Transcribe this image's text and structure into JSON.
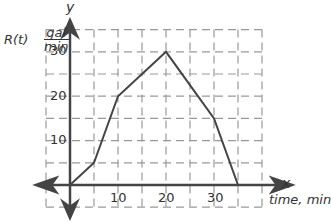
{
  "chart_data": {
    "type": "line",
    "title": "",
    "xlabel": "time, min",
    "ylabel": "R(t) gal/min",
    "x_axis_name": "x",
    "y_axis_name": "y",
    "x": [
      0,
      5,
      10,
      20,
      30,
      35
    ],
    "series": [
      {
        "name": "R(t)",
        "values": [
          0,
          5,
          20,
          30,
          15,
          0
        ]
      }
    ],
    "xlim": [
      -5,
      40
    ],
    "ylim": [
      -5,
      35
    ],
    "x_ticks": [
      10,
      20,
      30
    ],
    "y_ticks": [
      10,
      20,
      30
    ],
    "grid": true,
    "grid_style": "dashed",
    "grid_step": 5,
    "line_color": "#444444",
    "axis_color": "#444444",
    "grid_color": "#999999"
  },
  "labels": {
    "y_axis": "y",
    "x_axis": "x",
    "rt": "R(t)",
    "unit_num": "gal",
    "unit_den": "min",
    "x_title": "time, min",
    "ytick_30": "30",
    "ytick_20": "20",
    "ytick_10": "10",
    "xtick_10": "10",
    "xtick_20": "20",
    "xtick_30": "30"
  }
}
